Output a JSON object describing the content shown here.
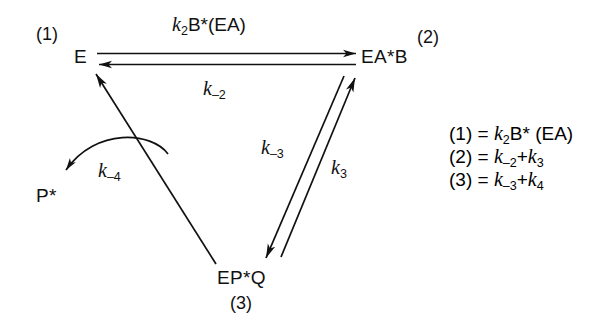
{
  "diagram": {
    "background_color": "#ffffff",
    "line_color": "#111111",
    "nodes": {
      "e": "E",
      "eab": "EA*B",
      "epq": "EP*Q",
      "p": "P*"
    },
    "tags": {
      "one": "(1)",
      "two": "(2)",
      "three": "(3)"
    },
    "rate_labels": {
      "k2_forward_k": "k",
      "k2_forward_sub": "2",
      "k2_forward_rest": "B*(EA)",
      "k_minus2_k": "k",
      "k_minus2_sub": "–2",
      "k_minus3_k": "k",
      "k_minus3_sub": "–3",
      "k3_k": "k",
      "k3_sub": "3",
      "k_minus4_k": "k",
      "k_minus4_sub": "–4"
    },
    "legend": [
      {
        "tag": "(1)",
        "eq": "=",
        "k": "k",
        "sub": "2",
        "rest": "B* (EA)"
      },
      {
        "tag": "(2)",
        "eq": "=",
        "k": "k",
        "sub": "–2",
        "rest": "+",
        "k2": "k",
        "sub2": "3"
      },
      {
        "tag": "(3)",
        "eq": "=",
        "k": "k",
        "sub": "–3",
        "rest": "+",
        "k2": "k",
        "sub2": "4"
      }
    ]
  }
}
